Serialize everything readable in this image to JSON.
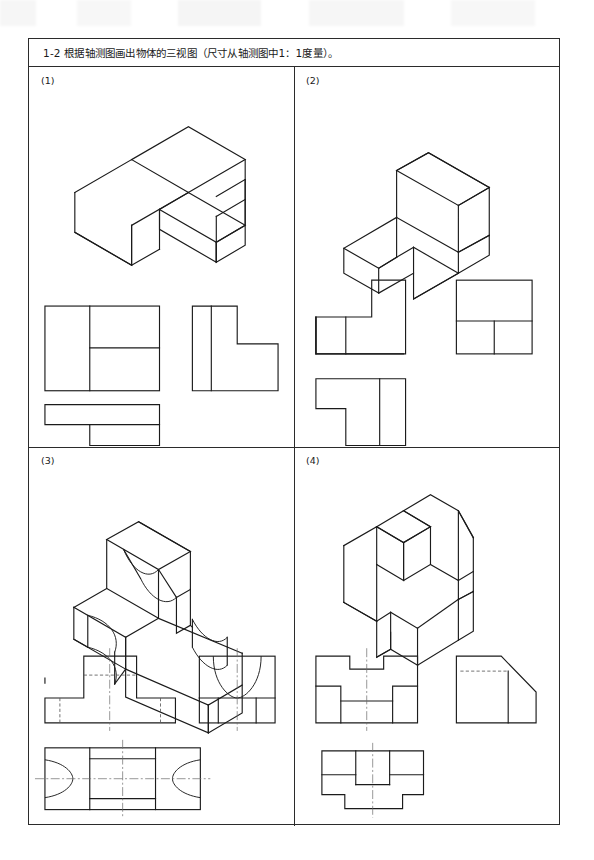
{
  "document": {
    "exercise_number": "1-2",
    "title": "1-2  根据轴测图画出物体的三视图（尺寸从轴测图中1：1度量）。",
    "page_width": 594,
    "page_height": 860
  },
  "ink_color": "#1b1b1b",
  "hidden_line_color": "#5a5a5a",
  "center_line_color": "#6b6b6b",
  "border_color": "#2b2b2b",
  "problems": [
    {
      "label": "(1)",
      "quadrant": "top-left",
      "isometric": {
        "name": "L-shaped stepped block",
        "description": "Upright L block with a lower forward step on the right"
      },
      "views": {
        "front": {
          "name": "front-view",
          "shape": "rectangle divided into left panel and two stacked right panels"
        },
        "side": {
          "name": "side-view",
          "shape": "L profile with vertical division near left edge"
        },
        "top": {
          "name": "top-view",
          "shape": "L-shaped outline opening to the lower left"
        }
      }
    },
    {
      "label": "(2)",
      "quadrant": "top-right",
      "isometric": {
        "name": "L-shaped block with raised rear riser",
        "description": "Flat L base with a tall rectangular riser at the rear right"
      },
      "views": {
        "front": {
          "name": "front-view",
          "shape": "stepped profile, tall block at right, low wing at left"
        },
        "side": {
          "name": "side-view",
          "shape": "rectangle with lower band split into two cells"
        },
        "top": {
          "name": "top-view",
          "shape": "L-shaped outline with a vertical division line"
        }
      }
    },
    {
      "label": "(3)",
      "quadrant": "bottom-left",
      "isometric": {
        "name": "T-slot base with semicircular cutouts",
        "description": "Long rectangular base with semicircular notches at both ends and a raised central rib with a concave top"
      },
      "views": {
        "front": {
          "name": "front-view",
          "shape": "T profile with hidden dashed lines and vertical centre line"
        },
        "side": {
          "name": "side-view",
          "shape": "rectangle with a large semicircular arc cut from the top"
        },
        "top": {
          "name": "top-view",
          "shape": "rectangle with semicircular notches at left and right plus central rib band and crossed centre lines"
        }
      }
    },
    {
      "label": "(4)",
      "quadrant": "bottom-right",
      "isometric": {
        "name": "Chamfered block with central channel",
        "description": "Rectangular block with a corner chamfer, raised rear section and a central channel groove"
      },
      "views": {
        "front": {
          "name": "front-view",
          "shape": "stepped notched profile with vertical centre line"
        },
        "side": {
          "name": "side-view",
          "shape": "rectangle with angled chamfer at top right and hidden dashed line"
        },
        "top": {
          "name": "top-view",
          "shape": "rectangular outline with central band and lower step, vertical centre line"
        }
      }
    }
  ]
}
